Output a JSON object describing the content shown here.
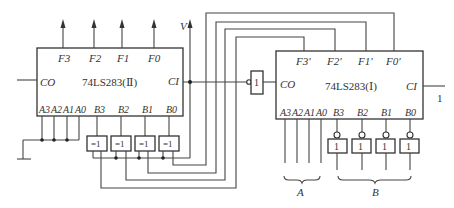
{
  "diagram": {
    "type": "digital-logic-circuit",
    "chip_left": {
      "name": "74LS283(Ⅱ)",
      "outputs": [
        "F3",
        "F2",
        "F1",
        "F0"
      ],
      "carry_out": "CO",
      "carry_in": "CI",
      "a_inputs": [
        "A3",
        "A2",
        "A1",
        "A0"
      ],
      "b_inputs": [
        "B3",
        "B2",
        "B1",
        "B0"
      ],
      "supply_label": "V"
    },
    "chip_right": {
      "name": "74LS283(Ⅰ)",
      "outputs": [
        "F3'",
        "F2'",
        "F1'",
        "F0'"
      ],
      "carry_out": "CO",
      "carry_in": "CI",
      "carry_in_value": "1",
      "a_inputs": [
        "A3",
        "A2",
        "A1",
        "A0"
      ],
      "b_inputs": [
        "B3",
        "B2",
        "B1",
        "B0"
      ]
    },
    "xor_gates": [
      "=1",
      "=1",
      "=1",
      "=1"
    ],
    "inverter_gates": [
      "1",
      "1",
      "1",
      "1"
    ],
    "carry_inverter": "1",
    "bus_labels": {
      "a": "A",
      "b": "B"
    }
  }
}
